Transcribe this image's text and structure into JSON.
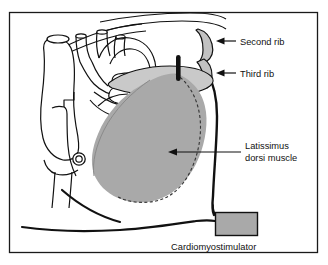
{
  "figure": {
    "type": "anatomical-diagram",
    "frame": {
      "visible": true,
      "color": "#1a1a1a"
    },
    "background": "#ffffff"
  },
  "colors": {
    "outline": "#111111",
    "muscle_fill": "#a9a9a9",
    "muscle_band_fill": "#c9c9c9",
    "rib_fill": "#c0c0c0",
    "device_fill": "#a9a9a9",
    "electrode": "#111111",
    "background": "#ffffff"
  },
  "labels": {
    "second_rib": "Second rib",
    "third_rib": "Third rib",
    "latissimus_line1": "Latissimus",
    "latissimus_line2": "dorsi muscle",
    "cardiomyostimulator": "Cardiomyostimulator"
  },
  "annotations": [
    {
      "name": "second-rib",
      "text": "Second rib",
      "arrow": "left",
      "arrow_tip": [
        222,
        41
      ],
      "text_anchor": [
        239,
        44
      ]
    },
    {
      "name": "third-rib",
      "text": "Third rib",
      "arrow": "left",
      "arrow_tip": [
        222,
        73
      ],
      "text_anchor": [
        239,
        76
      ]
    },
    {
      "name": "latissimus-dorsi-muscle",
      "text": "Latissimus dorsi muscle",
      "arrow": "left",
      "arrow_tip": [
        168,
        152
      ],
      "text_anchor": [
        245,
        149
      ]
    },
    {
      "name": "cardiomyostimulator",
      "text": "Cardiomyostimulator",
      "arrow": "none",
      "text_anchor": [
        236,
        247
      ]
    }
  ],
  "parts": [
    {
      "name": "heart-and-great-vessels",
      "style": "white-fill-black-outline"
    },
    {
      "name": "second-rib",
      "style": "gray-fill-black-outline"
    },
    {
      "name": "third-rib",
      "style": "gray-fill-black-outline"
    },
    {
      "name": "latissimus-dorsi-flap",
      "style": "gray-fill-dashed-edge"
    },
    {
      "name": "electrode-lead",
      "style": "solid-black-bar"
    },
    {
      "name": "cardiomyostimulator-device",
      "style": "gray-rect-black-outline"
    },
    {
      "name": "lead-wire",
      "style": "thin-black-curve"
    },
    {
      "name": "torso-contour",
      "style": "thick-black-curve"
    }
  ]
}
